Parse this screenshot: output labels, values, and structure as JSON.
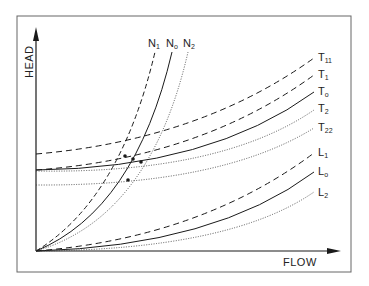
{
  "diagram": {
    "title": "",
    "x_axis": {
      "label": "FLOW"
    },
    "y_axis": {
      "label": "HEAD"
    },
    "colors": {
      "line": "#1a1a1a",
      "frame": "#555555",
      "background": "#ffffff"
    },
    "speed_curves": [
      {
        "id": "N1",
        "base": "N",
        "sub": "1",
        "style": "dashed"
      },
      {
        "id": "N0",
        "base": "N",
        "sub": "o",
        "style": "solid"
      },
      {
        "id": "N2",
        "base": "N",
        "sub": "2",
        "style": "dotted"
      }
    ],
    "system_curves_T": [
      {
        "id": "T11",
        "base": "T",
        "sub": "11",
        "style": "dashed"
      },
      {
        "id": "T1",
        "base": "T",
        "sub": "1",
        "style": "dashed"
      },
      {
        "id": "T0",
        "base": "T",
        "sub": "o",
        "style": "solid"
      },
      {
        "id": "T2",
        "base": "T",
        "sub": "2",
        "style": "dotted"
      },
      {
        "id": "T22",
        "base": "T",
        "sub": "22",
        "style": "dotted"
      }
    ],
    "system_curves_L": [
      {
        "id": "L1",
        "base": "L",
        "sub": "1",
        "style": "dashed"
      },
      {
        "id": "L0",
        "base": "L",
        "sub": "o",
        "style": "solid"
      },
      {
        "id": "L2",
        "base": "L",
        "sub": "2",
        "style": "dotted"
      }
    ]
  }
}
